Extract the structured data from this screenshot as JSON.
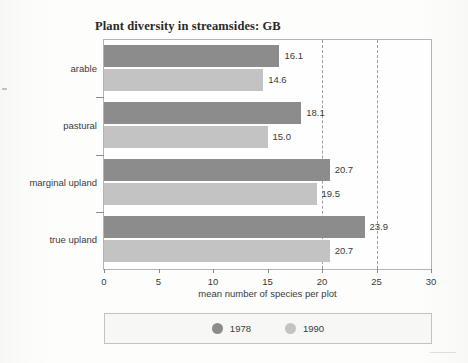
{
  "chart_data": {
    "type": "bar",
    "orientation": "horizontal",
    "title": "Plant diversity in streamsides: GB",
    "xlabel": "mean number of species per plot",
    "ylabel": "",
    "categories": [
      "arable",
      "pastural",
      "marginal upland",
      "true upland"
    ],
    "series": [
      {
        "name": "1978",
        "color": "#8c8c8c",
        "values": [
          16.1,
          18.1,
          20.7,
          23.9
        ]
      },
      {
        "name": "1990",
        "color": "#c3c3c3",
        "values": [
          14.6,
          15.0,
          19.5,
          20.7
        ]
      }
    ],
    "value_labels": {
      "1978": [
        "16.1",
        "18.1",
        "20.7",
        "23.9"
      ],
      "1990": [
        "14.6",
        "15.0",
        "19.5",
        "20.7"
      ]
    },
    "xlim": [
      0,
      30
    ],
    "xticks": [
      0,
      5,
      10,
      15,
      20,
      25,
      30
    ],
    "xtick_labels": [
      "0",
      "5",
      "10",
      "15",
      "20",
      "25",
      "30"
    ],
    "gridlines": {
      "x": [
        20,
        25
      ],
      "style": "dashed",
      "y": []
    },
    "legend": {
      "position": "bottom",
      "entries": [
        {
          "label": "1978",
          "color": "#8c8c8c",
          "marker": "circle"
        },
        {
          "label": "1990",
          "color": "#c3c3c3",
          "marker": "circle"
        }
      ]
    }
  }
}
